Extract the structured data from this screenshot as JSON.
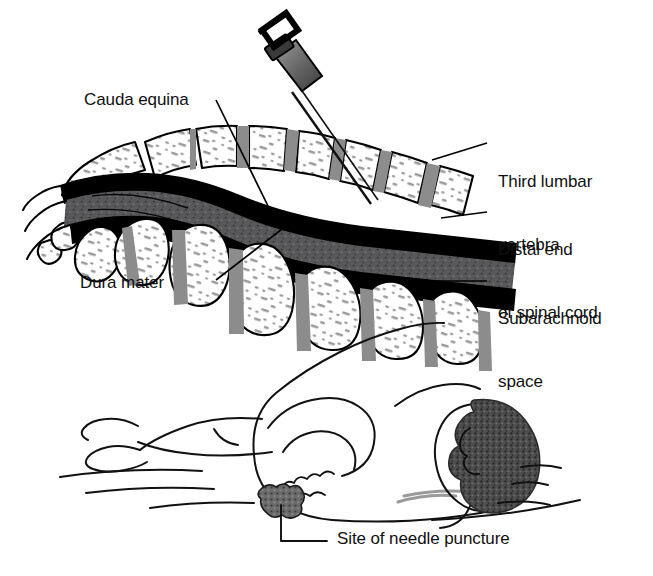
{
  "figure": {
    "panels": [
      {
        "name": "sagittal-lumbar-spine-section",
        "description": "Mid-sagittal section of lower spine with spinal needle inserted"
      },
      {
        "name": "patient-lateral-position",
        "description": "Patient lying on side in knee-chest (fetal) position"
      }
    ]
  },
  "labels": {
    "cauda_equina": "Cauda equina",
    "dura_mater": "Dura mater",
    "third_lumbar_vertebra_line1": "Third lumbar",
    "third_lumbar_vertebra_line2": "vertebra",
    "distal_end_line1": "Distal end",
    "distal_end_line2": "of spinal cord",
    "subarachnoid_line1": "Subarachnoid",
    "subarachnoid_line2": "space",
    "site_of_needle_puncture": "Site of needle puncture"
  },
  "icons": {
    "spinal_needle": "spinal-needle-icon",
    "vertebra": "vertebra-icon",
    "patient_body": "patient-body-icon",
    "puncture_marker": "puncture-site-icon"
  },
  "colors": {
    "outline": "#000000",
    "bone_fill": "#ffffff",
    "bone_speckle": "#9a9a9a",
    "disc_gray": "#8c8c8c",
    "dura_black": "#000000",
    "subarachnoid_gray": "#58585a",
    "needle_gray": "#6f6f6f",
    "needle_dark": "#2b2b2b",
    "hair_dark": "#4a4a4a",
    "puncture_gray": "#6b6b6b",
    "text": "#111111",
    "background": "#ffffff"
  }
}
